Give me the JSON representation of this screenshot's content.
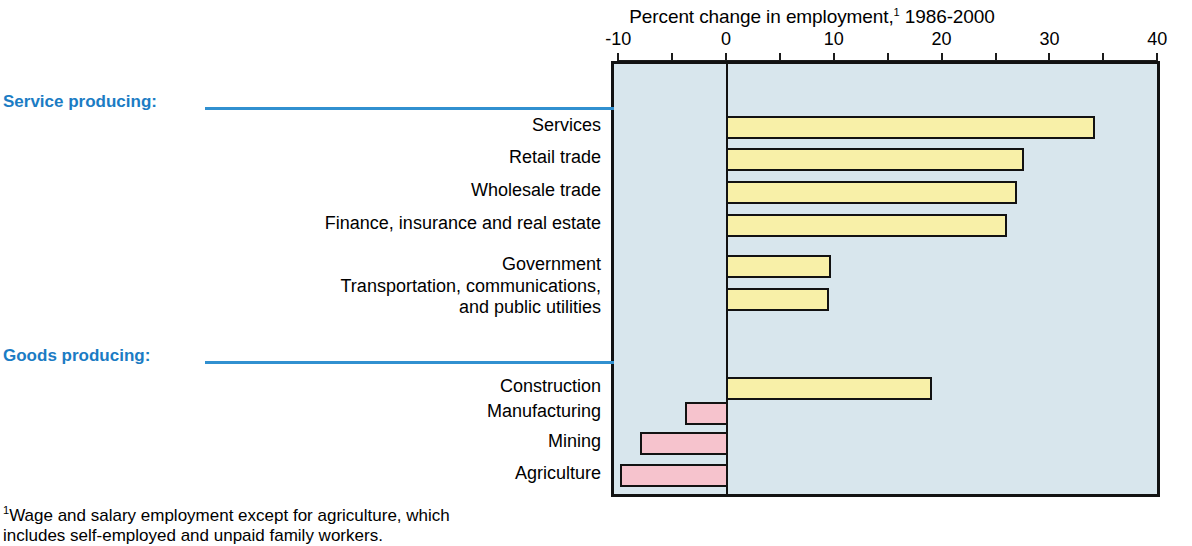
{
  "chart_data": {
    "type": "bar",
    "orientation": "horizontal",
    "title": "Percent change in employment,",
    "title_superscript": "1",
    "title_suffix": " 1986-2000",
    "xlabel": "",
    "ylabel": "",
    "xlim": [
      -10,
      40
    ],
    "xticks": [
      -10,
      -5,
      0,
      5,
      10,
      15,
      20,
      25,
      30,
      35,
      40
    ],
    "xtick_labels": [
      "-10",
      "",
      "0",
      "",
      "10",
      "",
      "20",
      "",
      "30",
      "",
      "40"
    ],
    "grid": false,
    "legend": "none",
    "groups": [
      {
        "name": "Service producing:",
        "categories": [
          "Services",
          "Retail trade",
          "Wholesale trade",
          "Finance, insurance and real estate",
          "Government",
          "Transportation, communications,\nand public utilities"
        ],
        "values": [
          34.0,
          27.5,
          26.8,
          25.9,
          9.6,
          9.4
        ]
      },
      {
        "name": "Goods producing:",
        "categories": [
          "Construction",
          "Manufacturing",
          "Mining",
          "Agriculture"
        ],
        "values": [
          18.9,
          -3.8,
          -8.0,
          -9.8
        ]
      }
    ],
    "categories": [
      "Services",
      "Retail trade",
      "Wholesale trade",
      "Finance, insurance and real estate",
      "Government",
      "Transportation, communications, and public utilities",
      "Construction",
      "Manufacturing",
      "Mining",
      "Agriculture"
    ],
    "values": [
      34.0,
      27.5,
      26.8,
      25.9,
      9.6,
      9.4,
      18.9,
      -3.8,
      -8.0,
      -9.8
    ],
    "colors": {
      "positive_bar": "#f8f0a8",
      "negative_bar": "#f6c3cd",
      "bar_outline": "#121212",
      "plot_background": "#d8e6ed",
      "group_heading": "#1b7cc4",
      "group_rule": "#3190d0"
    },
    "footnote": "Wage and salary employment except for agriculture, which includes self-employed and unpaid family workers.",
    "footnote_superscript": "1"
  },
  "axis": {
    "tick_labels": [
      {
        "value": -10,
        "label": "-10"
      },
      {
        "value": 0,
        "label": "0"
      },
      {
        "value": 10,
        "label": "10"
      },
      {
        "value": 20,
        "label": "20"
      },
      {
        "value": 30,
        "label": "30"
      },
      {
        "value": 40,
        "label": "40"
      }
    ]
  },
  "series_rows": [
    {
      "label": "Services",
      "value": 34.0,
      "group": "service",
      "sign": "positive"
    },
    {
      "label": "Retail trade",
      "value": 27.5,
      "group": "service",
      "sign": "positive"
    },
    {
      "label": "Wholesale trade",
      "value": 26.8,
      "group": "service",
      "sign": "positive"
    },
    {
      "label": "Finance, insurance and real estate",
      "value": 25.9,
      "group": "service",
      "sign": "positive"
    },
    {
      "label": "Government",
      "value": 9.6,
      "group": "service",
      "sign": "positive"
    },
    {
      "label": "Transportation, communications,",
      "label2": "and public utilities",
      "value": 9.4,
      "group": "service",
      "sign": "positive"
    },
    {
      "label": "Construction",
      "value": 18.9,
      "group": "goods",
      "sign": "positive"
    },
    {
      "label": "Manufacturing",
      "value": -3.8,
      "group": "goods",
      "sign": "negative"
    },
    {
      "label": "Mining",
      "value": -8.0,
      "group": "goods",
      "sign": "negative"
    },
    {
      "label": "Agriculture",
      "value": -9.8,
      "group": "goods",
      "sign": "negative"
    }
  ],
  "headings": {
    "service": "Service producing:",
    "goods": "Goods producing:"
  },
  "footnote": {
    "marker": "1",
    "line1": "Wage and salary employment except for agriculture, which",
    "line2": "includes self-employed and unpaid family workers."
  }
}
